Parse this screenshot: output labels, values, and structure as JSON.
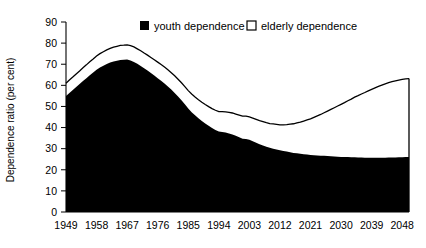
{
  "chart_data": {
    "type": "area",
    "title": "",
    "subtitle": "",
    "xlabel": "",
    "ylabel": "Dependence ratio (per cent)",
    "stacked": true,
    "grid": false,
    "legend_position": "top-center",
    "xlim": [
      1949,
      2050
    ],
    "ylim": [
      0,
      90
    ],
    "ytick_step": 10,
    "yticks": [
      0,
      10,
      20,
      30,
      40,
      50,
      60,
      70,
      80,
      90
    ],
    "ytick_labels": [
      "0",
      "10",
      "20",
      "30",
      "40",
      "50",
      "60",
      "70",
      "80",
      "90"
    ],
    "xticks": [
      1949,
      1958,
      1967,
      1976,
      1985,
      1994,
      2003,
      2012,
      2021,
      2030,
      2039,
      2048
    ],
    "xtick_labels": [
      "1949",
      "1958",
      "1967",
      "1976",
      "1985",
      "1994",
      "2003",
      "2012",
      "2021",
      "2030",
      "2039",
      "2048"
    ],
    "legend": [
      {
        "label": "youth dependence",
        "marker": "filled-square",
        "color": "#000000"
      },
      {
        "label": "elderly dependence",
        "marker": "hollow-square",
        "color": "#ffffff"
      }
    ],
    "x": [
      1949,
      1950,
      1951,
      1952,
      1953,
      1954,
      1955,
      1956,
      1957,
      1958,
      1959,
      1960,
      1961,
      1962,
      1963,
      1964,
      1965,
      1966,
      1967,
      1968,
      1969,
      1970,
      1971,
      1972,
      1973,
      1974,
      1975,
      1976,
      1977,
      1978,
      1979,
      1980,
      1981,
      1982,
      1983,
      1984,
      1985,
      1986,
      1987,
      1988,
      1989,
      1990,
      1991,
      1992,
      1993,
      1994,
      1995,
      1996,
      1997,
      1998,
      1999,
      2000,
      2001,
      2002,
      2003,
      2004,
      2005,
      2006,
      2007,
      2008,
      2009,
      2010,
      2011,
      2012,
      2013,
      2014,
      2015,
      2016,
      2017,
      2018,
      2019,
      2020,
      2021,
      2022,
      2023,
      2024,
      2025,
      2026,
      2027,
      2028,
      2029,
      2030,
      2031,
      2032,
      2033,
      2034,
      2035,
      2036,
      2037,
      2038,
      2039,
      2040,
      2041,
      2042,
      2043,
      2044,
      2045,
      2046,
      2047,
      2048,
      2049,
      2050
    ],
    "series": [
      {
        "name": "youth dependence",
        "color": "#000000",
        "values": [
          55.0,
          56.4,
          57.8,
          59.2,
          60.6,
          62.0,
          63.4,
          64.8,
          66.1,
          67.4,
          68.4,
          69.3,
          70.1,
          70.8,
          71.3,
          71.7,
          72.0,
          72.1,
          72.2,
          71.8,
          71.1,
          70.2,
          69.2,
          68.1,
          67.0,
          65.8,
          64.6,
          63.4,
          62.2,
          60.9,
          59.5,
          58.0,
          56.4,
          54.7,
          52.9,
          51.0,
          49.0,
          47.3,
          45.8,
          44.4,
          43.1,
          41.9,
          40.8,
          39.8,
          38.9,
          38.1,
          37.9,
          37.6,
          37.2,
          36.7,
          36.1,
          35.4,
          34.7,
          34.6,
          34.2,
          33.5,
          32.8,
          32.1,
          31.5,
          30.9,
          30.4,
          30.0,
          29.6,
          29.2,
          28.9,
          28.6,
          28.3,
          28.0,
          27.8,
          27.6,
          27.4,
          27.2,
          27.0,
          26.9,
          26.8,
          26.7,
          26.6,
          26.5,
          26.4,
          26.3,
          26.2,
          26.1,
          26.0,
          26.0,
          25.9,
          25.9,
          25.8,
          25.8,
          25.7,
          25.7,
          25.7,
          25.7,
          25.7,
          25.7,
          25.7,
          25.8,
          25.8,
          25.8,
          25.9,
          25.9,
          26.0,
          26.0
        ]
      },
      {
        "name": "elderly dependence",
        "color": "#ffffff",
        "values": [
          6.0,
          6.1,
          6.1,
          6.2,
          6.2,
          6.3,
          6.3,
          6.4,
          6.4,
          6.5,
          6.6,
          6.6,
          6.7,
          6.7,
          6.8,
          6.8,
          6.9,
          6.9,
          7.0,
          7.0,
          7.1,
          7.1,
          7.2,
          7.2,
          7.3,
          7.4,
          7.5,
          7.6,
          7.7,
          7.8,
          7.9,
          8.0,
          8.1,
          8.2,
          8.3,
          8.4,
          8.5,
          8.6,
          8.7,
          8.8,
          8.9,
          9.0,
          9.1,
          9.2,
          9.3,
          9.4,
          9.6,
          9.8,
          10.0,
          10.2,
          10.3,
          10.5,
          10.7,
          10.8,
          10.9,
          11.0,
          11.1,
          11.2,
          11.3,
          11.4,
          11.5,
          11.7,
          11.9,
          12.1,
          12.4,
          12.8,
          13.3,
          13.8,
          14.4,
          15.0,
          15.7,
          16.4,
          17.1,
          17.9,
          18.7,
          19.5,
          20.4,
          21.3,
          22.2,
          23.1,
          24.0,
          24.9,
          25.8,
          26.7,
          27.6,
          28.5,
          29.3,
          30.1,
          30.9,
          31.7,
          32.4,
          33.1,
          33.8,
          34.4,
          35.0,
          35.5,
          35.9,
          36.3,
          36.6,
          36.9,
          37.1,
          37.2
        ]
      }
    ],
    "total": {
      "name": "total dependence",
      "values": [
        61.0,
        62.5,
        63.9,
        65.4,
        66.8,
        68.3,
        69.7,
        71.2,
        72.5,
        73.9,
        75.0,
        75.9,
        76.8,
        77.5,
        78.1,
        78.5,
        78.9,
        79.0,
        79.2,
        78.8,
        78.2,
        77.3,
        76.4,
        75.3,
        74.3,
        73.2,
        72.1,
        71.0,
        69.9,
        68.7,
        67.4,
        66.0,
        64.5,
        62.9,
        61.2,
        59.4,
        57.5,
        55.9,
        54.5,
        53.2,
        52.0,
        50.9,
        49.9,
        49.0,
        48.2,
        47.5,
        47.5,
        47.4,
        47.2,
        46.9,
        46.4,
        45.9,
        45.4,
        45.4,
        45.1,
        44.5,
        43.9,
        43.3,
        42.8,
        42.3,
        41.9,
        41.7,
        41.5,
        41.3,
        41.3,
        41.4,
        41.6,
        41.8,
        42.2,
        42.6,
        43.1,
        43.6,
        44.1,
        44.8,
        45.5,
        46.2,
        47.0,
        47.8,
        48.6,
        49.4,
        50.2,
        51.0,
        51.8,
        52.7,
        53.5,
        54.4,
        55.1,
        55.9,
        56.6,
        57.4,
        58.1,
        58.8,
        59.5,
        60.1,
        60.7,
        61.3,
        61.7,
        62.1,
        62.5,
        62.8,
        63.1,
        63.2
      ]
    }
  },
  "legend": {
    "youth_label": "youth dependence",
    "elderly_label": "elderly dependence"
  },
  "axes": {
    "y_title": "Dependence ratio (per cent)"
  }
}
